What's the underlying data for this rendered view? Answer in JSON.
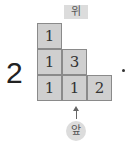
{
  "problem_number": "2",
  "labels": {
    "top": "위",
    "front": "앞"
  },
  "terminal_mark": "•",
  "grid": {
    "description": "Top-view stacking plan with cube counts per position",
    "rows": [
      [
        "1",
        "",
        ""
      ],
      [
        "1",
        "3",
        ""
      ],
      [
        "1",
        "1",
        "2"
      ]
    ],
    "cells": [
      {
        "row": 0,
        "col": 0,
        "value": "1"
      },
      {
        "row": 1,
        "col": 0,
        "value": "1"
      },
      {
        "row": 1,
        "col": 1,
        "value": "3"
      },
      {
        "row": 2,
        "col": 0,
        "value": "1"
      },
      {
        "row": 2,
        "col": 1,
        "value": "1"
      },
      {
        "row": 2,
        "col": 2,
        "value": "2"
      }
    ]
  },
  "colors": {
    "cell_fill": "#cfcfcf",
    "cell_border": "#8a8a8a",
    "label_bg": "#dcdcdc"
  }
}
